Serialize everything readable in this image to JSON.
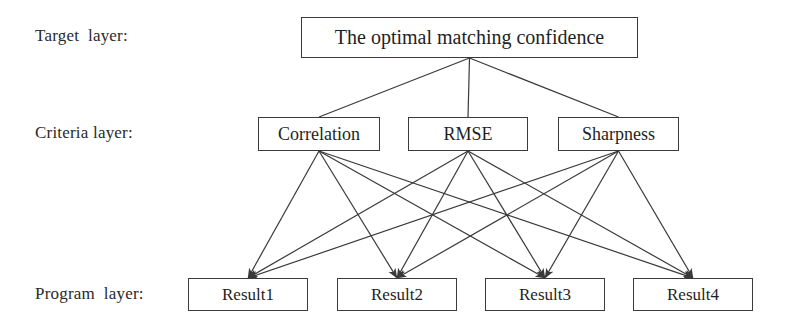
{
  "diagram": {
    "type": "hierarchy-tree",
    "title_text": "",
    "background_color": "#ffffff",
    "line_color": "#3a3a3a",
    "box_border_color": "#3a3a3a",
    "text_color": "#1f1f1f",
    "layers": [
      {
        "id": "target",
        "label": "Target  layer:",
        "nodes": [
          {
            "id": "target-1",
            "label": "The optimal matching confidence",
            "x": 301,
            "y": 17,
            "w": 337,
            "h": 41
          }
        ]
      },
      {
        "id": "criteria",
        "label": "Criteria layer:",
        "nodes": [
          {
            "id": "criteria-1",
            "label": "Correlation",
            "x": 258,
            "y": 117,
            "w": 122,
            "h": 34
          },
          {
            "id": "criteria-2",
            "label": "RMSE",
            "x": 408,
            "y": 117,
            "w": 120,
            "h": 34
          },
          {
            "id": "criteria-3",
            "label": "Sharpness",
            "x": 558,
            "y": 117,
            "w": 121,
            "h": 34
          }
        ]
      },
      {
        "id": "program",
        "label": "Program  layer:",
        "nodes": [
          {
            "id": "program-1",
            "label": "Result1",
            "x": 188,
            "y": 278,
            "w": 120,
            "h": 33
          },
          {
            "id": "program-2",
            "label": "Result2",
            "x": 337,
            "y": 278,
            "w": 120,
            "h": 33
          },
          {
            "id": "program-3",
            "label": "Result3",
            "x": 485,
            "y": 278,
            "w": 120,
            "h": 33
          },
          {
            "id": "program-4",
            "label": "Result4",
            "x": 633,
            "y": 278,
            "w": 120,
            "h": 33
          }
        ]
      }
    ],
    "edges": {
      "target_to_criteria": [
        {
          "from": "target-1",
          "to": "criteria-1",
          "arrow": false
        },
        {
          "from": "target-1",
          "to": "criteria-2",
          "arrow": false
        },
        {
          "from": "target-1",
          "to": "criteria-3",
          "arrow": false
        }
      ],
      "criteria_to_program": [
        {
          "from": "criteria-1",
          "to": "program-1",
          "arrow": true
        },
        {
          "from": "criteria-1",
          "to": "program-2",
          "arrow": true
        },
        {
          "from": "criteria-1",
          "to": "program-3",
          "arrow": true
        },
        {
          "from": "criteria-1",
          "to": "program-4",
          "arrow": true
        },
        {
          "from": "criteria-2",
          "to": "program-1",
          "arrow": true
        },
        {
          "from": "criteria-2",
          "to": "program-2",
          "arrow": true
        },
        {
          "from": "criteria-2",
          "to": "program-3",
          "arrow": true
        },
        {
          "from": "criteria-2",
          "to": "program-4",
          "arrow": true
        },
        {
          "from": "criteria-3",
          "to": "program-1",
          "arrow": true
        },
        {
          "from": "criteria-3",
          "to": "program-2",
          "arrow": true
        },
        {
          "from": "criteria-3",
          "to": "program-3",
          "arrow": true
        },
        {
          "from": "criteria-3",
          "to": "program-4",
          "arrow": true
        }
      ]
    }
  }
}
